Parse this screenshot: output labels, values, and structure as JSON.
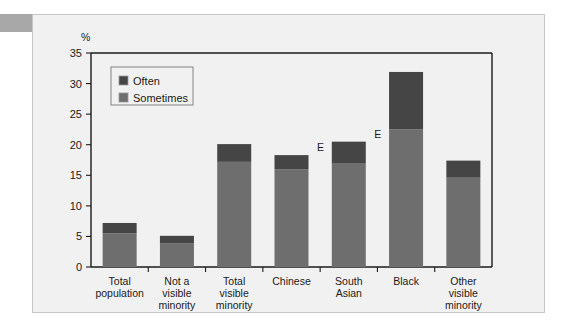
{
  "card": {
    "background_color": "#f1f1f1",
    "border_color": "#c6c6c6"
  },
  "corner_tab": {
    "label": "",
    "color": "#a8a8a8"
  },
  "chart_data": {
    "type": "bar",
    "subtype": "stacked-vertical",
    "title": "",
    "unit_label": "%",
    "xlabel": "",
    "ylabel": "",
    "ylim": [
      0,
      35
    ],
    "ytick_step": 5,
    "ytick_labels": [
      "0",
      "5",
      "10",
      "15",
      "20",
      "25",
      "30",
      "35"
    ],
    "ytick_values": [
      0,
      5,
      10,
      15,
      20,
      25,
      30,
      35
    ],
    "grid": false,
    "legend_position": "top-left-inside",
    "categories": [
      "Total population",
      "Not a visible minority",
      "Total visible minority",
      "Chinese",
      "South Asian",
      "Black",
      "Other visible minority"
    ],
    "category_lines": [
      [
        "Total",
        "population"
      ],
      [
        "Not a",
        "visible",
        "minority"
      ],
      [
        "Total",
        "visible",
        "minority"
      ],
      [
        "Chinese"
      ],
      [
        "South",
        "Asian"
      ],
      [
        "Black"
      ],
      [
        "Other",
        "visible",
        "minority"
      ]
    ],
    "series": [
      {
        "name": "Sometimes",
        "color": "#6e6e6e",
        "values": [
          5.5,
          3.9,
          17.2,
          16.0,
          16.9,
          22.5,
          14.6
        ]
      },
      {
        "name": "Often",
        "color": "#454545",
        "values": [
          1.7,
          1.2,
          2.9,
          2.3,
          3.6,
          9.4,
          2.8
        ]
      }
    ],
    "totals": [
      7.2,
      5.1,
      20.1,
      18.3,
      20.5,
      31.9,
      17.4
    ],
    "annotations": [
      {
        "text": "E",
        "category": "Chinese",
        "value": 18.3
      },
      {
        "text": "E",
        "category": "South Asian",
        "value": 20.5
      }
    ]
  },
  "legend": {
    "items": [
      {
        "label": "Often",
        "color": "#454545"
      },
      {
        "label": "Sometimes",
        "color": "#6e6e6e"
      }
    ]
  }
}
